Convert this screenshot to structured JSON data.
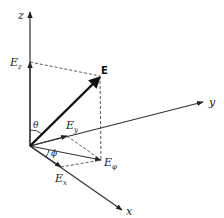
{
  "diagram": {
    "colors": {
      "line": "#333333",
      "vector": "#111111",
      "dashed": "#444444",
      "background": "#ffffff"
    },
    "axes": [
      {
        "name": "z",
        "label": "z"
      },
      {
        "name": "y",
        "label": "y"
      },
      {
        "name": "x",
        "label": "x"
      }
    ],
    "vectors": [
      {
        "name": "E",
        "label": "E"
      },
      {
        "name": "E_z",
        "label": "E",
        "subscript": "z"
      },
      {
        "name": "E_y",
        "label": "E",
        "subscript": "y"
      },
      {
        "name": "E_x",
        "label": "E",
        "subscript": "x"
      },
      {
        "name": "E_phi",
        "label": "E",
        "subscript": "φ"
      }
    ],
    "angles": [
      {
        "name": "theta",
        "label": "θ"
      },
      {
        "name": "phi",
        "label": "ϕ"
      }
    ]
  }
}
